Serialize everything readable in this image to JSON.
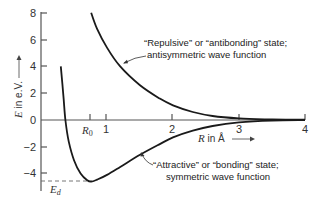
{
  "chart_data": {
    "type": "line",
    "title": "",
    "xlabel": "R in Å",
    "ylabel": "E in e.V.",
    "xlim": [
      0,
      4
    ],
    "ylim": [
      -5,
      8
    ],
    "grid": false,
    "x_ticks": [
      {
        "value": 0.74,
        "label": "R₀"
      },
      {
        "value": 1,
        "label": "1"
      },
      {
        "value": 2,
        "label": "2"
      },
      {
        "value": 3,
        "label": "3"
      },
      {
        "value": 4,
        "label": "4"
      }
    ],
    "y_ticks": [
      {
        "value": 8,
        "label": "8"
      },
      {
        "value": 6,
        "label": "6"
      },
      {
        "value": 4,
        "label": "4"
      },
      {
        "value": 2,
        "label": "2"
      },
      {
        "value": 0,
        "label": "0"
      },
      {
        "value": -2,
        "label": "−2"
      },
      {
        "value": -4,
        "label": "−4"
      }
    ],
    "series": [
      {
        "name": "Repulsive / antibonding (antisymmetric wave function)",
        "x": [
          0.76,
          0.85,
          1.0,
          1.2,
          1.5,
          1.8,
          2.0,
          2.3,
          2.6,
          3.0,
          3.5,
          4.0
        ],
        "y": [
          8.0,
          6.8,
          5.4,
          4.0,
          2.6,
          1.6,
          1.1,
          0.6,
          0.3,
          0.12,
          0.04,
          0.02
        ]
      },
      {
        "name": "Attractive / bonding (symmetric wave function)",
        "x": [
          0.3,
          0.34,
          0.37,
          0.42,
          0.5,
          0.6,
          0.7,
          0.76,
          0.85,
          1.0,
          1.2,
          1.5,
          1.8,
          2.0,
          2.3,
          2.6,
          3.0,
          3.5,
          4.0
        ],
        "y": [
          4.0,
          1.8,
          0.0,
          -1.6,
          -3.0,
          -4.0,
          -4.5,
          -4.6,
          -4.45,
          -4.1,
          -3.5,
          -2.6,
          -1.8,
          -1.3,
          -0.8,
          -0.45,
          -0.18,
          -0.05,
          -0.01
        ]
      }
    ],
    "annotations": [
      {
        "text_line1": "“Repulsive” or “antibonding” state;",
        "text_line2": "antisymmetric wave function",
        "points_to": "repulsive curve"
      },
      {
        "text_line1": "“Attractive” or “bonding” state;",
        "text_line2": "symmetric wave function",
        "points_to": "attractive curve"
      },
      {
        "text": "E_d",
        "meaning": "dissociation energy, dashed line at curve minimum (≈ −4.5 eV)",
        "value": -4.5
      },
      {
        "text": "R₀",
        "meaning": "equilibrium separation",
        "value": 0.74
      }
    ]
  },
  "labels": {
    "ylabel_italic": "E",
    "ylabel_rest": " in e.V.",
    "xlabel_italic": "R",
    "xlabel_rest": " in Å",
    "ed_main": "E",
    "ed_sub": "d",
    "r0_main": "R",
    "r0_sub": "0",
    "rep_line1": "“Repulsive” or “antibonding” state;",
    "rep_line2": "antisymmetric wave function",
    "att_line1": "“Attractive” or “bonding” state;",
    "att_line2": "symmetric wave function",
    "tick_1": "1",
    "tick_2": "2",
    "tick_3": "3",
    "tick_4": "4",
    "ytick_8": "8",
    "ytick_6": "6",
    "ytick_4": "4",
    "ytick_2": "2",
    "ytick_0": "0",
    "ytick_m2": "−2",
    "ytick_m4": "−4"
  }
}
